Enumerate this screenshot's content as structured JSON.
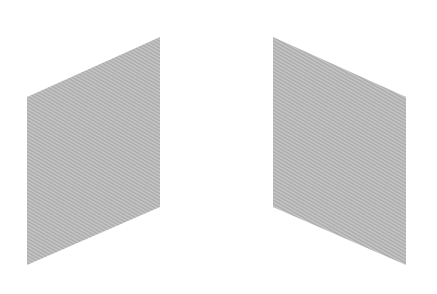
{
  "figure": {
    "width": 437,
    "height": 294,
    "background": "#ffffff",
    "fill_base": "#b9b9b9",
    "fill_stripe_light": "#c8c8c8",
    "fill_stripe_dark": "#a9a9a9",
    "shapes": [
      {
        "name": "left-parallelogram",
        "points": "27,97 160,37 160,207 27,265"
      },
      {
        "name": "right-parallelogram",
        "points": "273,37 406,97 406,265 273,207"
      }
    ]
  }
}
